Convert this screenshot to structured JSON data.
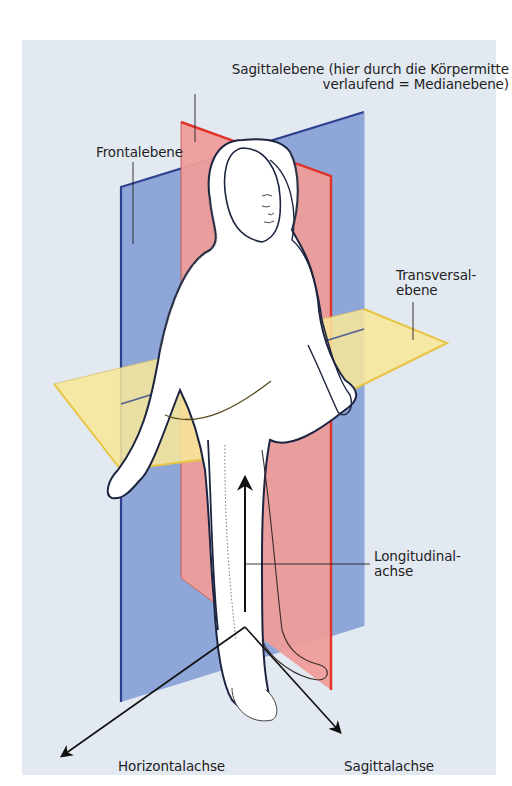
{
  "figure": {
    "background_color": "#e3e9f1",
    "planes": {
      "frontal": {
        "label": "Frontalebene",
        "fill": "#8aa3d6",
        "stroke": "#2e3f8f"
      },
      "sagittal": {
        "label_line1": "Sagittalebene (hier durch die Körpermitte",
        "label_line2": "verlaufend = Medianebene)",
        "fill": "#ec9a98",
        "stroke": "#e0332b"
      },
      "transversal": {
        "label_line1": "Transversal-",
        "label_line2": "ebene",
        "fill": "#f6e593",
        "stroke": "#e8c443"
      }
    },
    "axes": {
      "longitudinal": {
        "label_line1": "Longitudinal-",
        "label_line2": "achse"
      },
      "horizontal": {
        "label": "Horizontalachse"
      },
      "sagittal": {
        "label": "Sagittalachse"
      }
    }
  }
}
